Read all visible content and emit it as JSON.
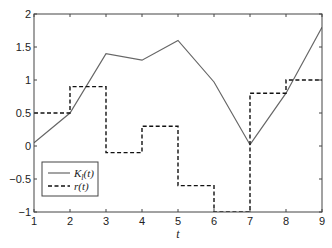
{
  "chart_data": {
    "type": "line",
    "title": "",
    "xlabel": "t",
    "ylabel": "",
    "xlim": [
      1,
      9
    ],
    "ylim": [
      -1,
      2
    ],
    "xticks": [
      1,
      2,
      3,
      4,
      5,
      6,
      7,
      8,
      9
    ],
    "yticks": [
      -1,
      -0.5,
      0,
      0.5,
      1,
      1.5,
      2
    ],
    "ytick_labels": [
      "−1",
      "−0.5",
      "0",
      "0.5",
      "1",
      "1.5",
      "2"
    ],
    "grid": false,
    "legend_position": "lower left",
    "series": [
      {
        "name": "K_l(t)",
        "legend_label": "K",
        "legend_sub": "l",
        "legend_suffix": "(t)",
        "style": "solid",
        "color": "#666666",
        "x": [
          1,
          2,
          3,
          4,
          5,
          6,
          7,
          8,
          9
        ],
        "values": [
          0.05,
          0.5,
          1.4,
          1.3,
          1.6,
          0.97,
          0.02,
          0.8,
          1.8
        ]
      },
      {
        "name": "r(t)",
        "legend_label": "r(t)",
        "style": "dashed-step",
        "color": "#111111",
        "x": [
          1,
          2,
          3,
          4,
          5,
          6,
          7,
          8,
          9
        ],
        "values": [
          0.5,
          0.9,
          -0.1,
          0.3,
          -0.6,
          -1.0,
          0.8,
          1.0,
          1.0
        ]
      }
    ]
  }
}
